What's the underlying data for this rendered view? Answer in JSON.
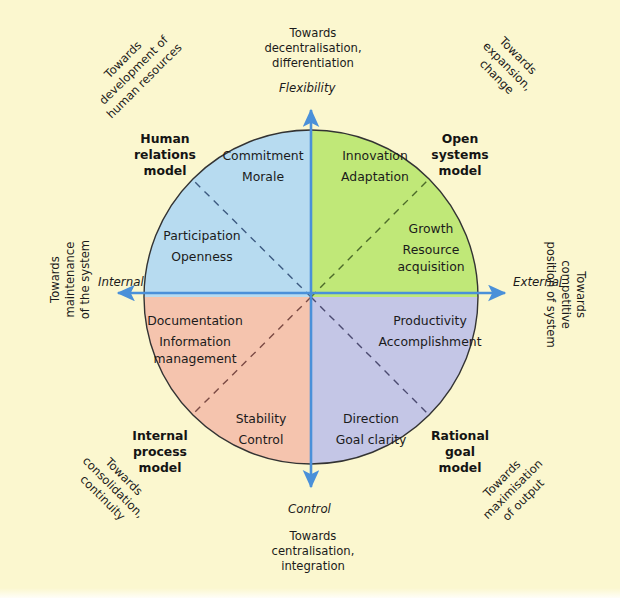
{
  "figure": {
    "background_color": "#fbf7cf"
  },
  "axes": {
    "vertical_top_label": "Flexibility",
    "vertical_bottom_label": "Control",
    "horizontal_left_label": "Internal",
    "horizontal_right_label": "External",
    "axis_color": "#4a90d9"
  },
  "outer_labels": {
    "top": "Towards\ndecentralisation,\ndifferentiation",
    "top_line1": "Towards",
    "top_line2": "decentralisation,",
    "top_line3": "differentiation",
    "bottom_line1": "Towards",
    "bottom_line2": "centralisation,",
    "bottom_line3": "integration",
    "left_line1": "Towards",
    "left_line2": "maintenance",
    "left_line3": "of the system",
    "right_line1": "Towards",
    "right_line2": "competitive",
    "right_line3": "position of system",
    "top_left_line1": "Towards",
    "top_left_line2": "development of",
    "top_left_line3": "human resources",
    "top_right_line1": "Towards",
    "top_right_line2": "expansion,",
    "top_right_line3": "change",
    "bottom_left_line1": "Towards",
    "bottom_left_line2": "consolidation,",
    "bottom_left_line3": "continuity",
    "bottom_right_line1": "Towards",
    "bottom_right_line2": "maximisation",
    "bottom_right_line3": "of output"
  },
  "quadrants": [
    {
      "id": "human-relations",
      "model_line1": "Human",
      "model_line2": "relations",
      "model_line3": "model",
      "color": "#b7dbf0",
      "inner_terms": [
        "Commitment",
        "Morale"
      ],
      "outer_terms": [
        "Participation",
        "Openness"
      ]
    },
    {
      "id": "open-systems",
      "model_line1": "Open",
      "model_line2": "systems",
      "model_line3": "model",
      "color": "#c0e878",
      "inner_terms": [
        "Innovation",
        "Adaptation"
      ],
      "outer_terms": [
        "Growth",
        "Resource",
        "acquisition"
      ]
    },
    {
      "id": "internal-process",
      "model_line1": "Internal",
      "model_line2": "process",
      "model_line3": "model",
      "color": "#f5c4ae",
      "inner_terms": [
        "Documentation",
        "Information",
        "management"
      ],
      "outer_terms": [
        "Stability",
        "Control"
      ]
    },
    {
      "id": "rational-goal",
      "model_line1": "Rational",
      "model_line2": "goal",
      "model_line3": "model",
      "color": "#c4c6e6",
      "inner_terms": [
        "Productivity",
        "Accomplishment"
      ],
      "outer_terms": [
        "Direction",
        "Goal clarity"
      ]
    }
  ],
  "quadrant_terms": {
    "hr_a": "Commitment",
    "hr_b": "Morale",
    "hr_c": "Participation",
    "hr_d": "Openness",
    "os_a": "Innovation",
    "os_b": "Adaptation",
    "os_c": "Growth",
    "os_d": "Resource",
    "os_e": "acquisition",
    "ip_a": "Documentation",
    "ip_b": "Information",
    "ip_c": "management",
    "ip_d": "Stability",
    "ip_e": "Control",
    "rg_a": "Productivity",
    "rg_b": "Accomplishment",
    "rg_c": "Direction",
    "rg_d": "Goal clarity"
  },
  "geometry": {
    "center_x": 311,
    "center_y": 297,
    "radius": 167
  }
}
